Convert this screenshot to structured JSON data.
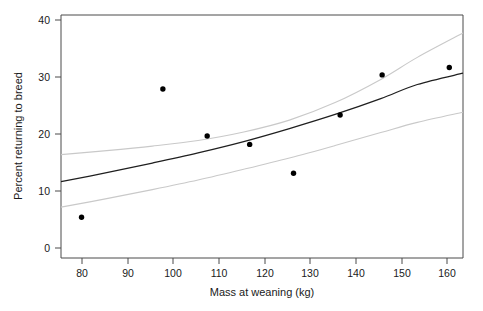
{
  "chart_data": {
    "type": "scatter",
    "title": "",
    "xlabel": "Mass at weaning (kg)",
    "ylabel": "Percent returning to breed",
    "xlim": [
      74,
      162
    ],
    "ylim": [
      -1.5,
      41.5
    ],
    "xticks": [
      80,
      90,
      100,
      110,
      120,
      130,
      140,
      150,
      160
    ],
    "yticks": [
      0,
      10,
      20,
      30,
      40
    ],
    "xticklabels": [
      "80",
      "90",
      "100",
      "110",
      "120",
      "130",
      "140",
      "150",
      "160"
    ],
    "yticklabels": [
      "0",
      "10",
      "20",
      "30",
      "40"
    ],
    "grid": false,
    "legend": "none",
    "points": [
      {
        "x": 78.5,
        "y": 5.7
      },
      {
        "x": 96.3,
        "y": 28.4
      },
      {
        "x": 106.0,
        "y": 20.1
      },
      {
        "x": 115.3,
        "y": 18.6
      },
      {
        "x": 124.9,
        "y": 13.5
      },
      {
        "x": 135.1,
        "y": 23.8
      },
      {
        "x": 144.3,
        "y": 30.9
      },
      {
        "x": 159.0,
        "y": 32.2
      }
    ],
    "series": [
      {
        "name": "fitted curve",
        "color": "#1f1f1f",
        "x": [
          74,
          84,
          94,
          104,
          114,
          124,
          134,
          144,
          152,
          162
        ],
        "values": [
          12.0,
          13.6,
          15.3,
          17.1,
          19.1,
          21.4,
          23.9,
          26.7,
          29.2,
          31.2
        ]
      },
      {
        "name": "upper confidence band",
        "color": "#c9c9c9",
        "x": [
          74,
          84,
          94,
          104,
          114,
          124,
          134,
          144,
          152,
          162
        ],
        "values": [
          16.8,
          17.5,
          18.3,
          19.3,
          20.8,
          22.9,
          26.0,
          30.1,
          34.0,
          38.3
        ]
      },
      {
        "name": "lower confidence band",
        "color": "#c9c9c9",
        "x": [
          74,
          84,
          94,
          104,
          114,
          124,
          134,
          144,
          152,
          162
        ],
        "values": [
          7.5,
          9.0,
          10.6,
          12.3,
          14.2,
          16.2,
          18.4,
          20.7,
          22.5,
          24.3
        ]
      }
    ]
  }
}
